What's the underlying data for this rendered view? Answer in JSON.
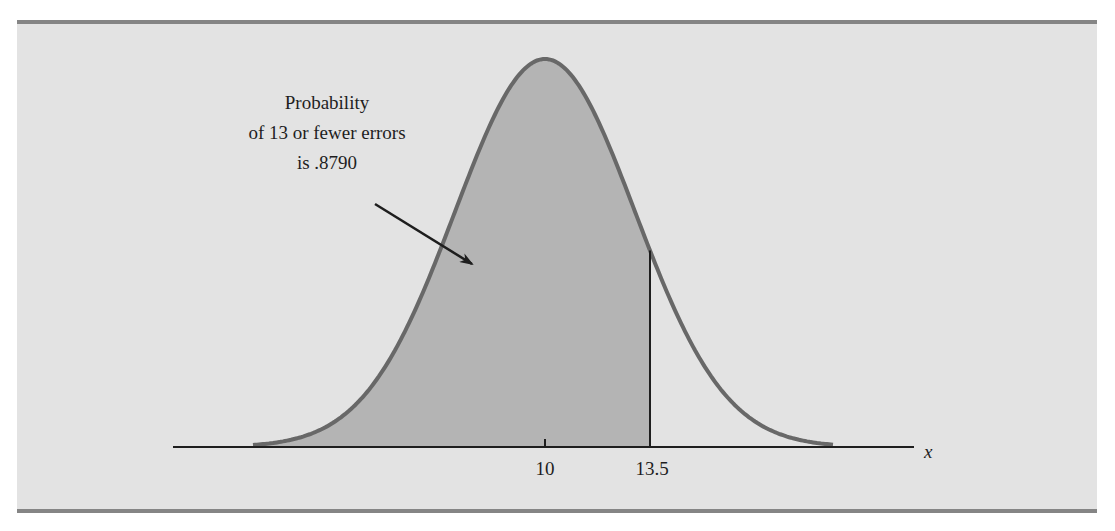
{
  "chart_data": {
    "type": "area",
    "distribution": {
      "mean": 10,
      "std_dev": 3
    },
    "shaded_region": {
      "from": "-inf",
      "to": 13.5,
      "probability": 0.879
    },
    "x_ticks": [
      {
        "value": 10,
        "label": "10"
      },
      {
        "value": 13.5,
        "label": "13.5"
      }
    ],
    "xlabel": "x",
    "ylabel": "",
    "annotation": {
      "lines": [
        "Probability",
        "of 13 or fewer errors",
        "is .8790"
      ],
      "arrow": true
    },
    "colors": {
      "background": "#e3e3e3",
      "shade": "#b4b4b4",
      "curve": "#686868",
      "axis": "#1e1e1e",
      "frame_border": "#858585"
    }
  }
}
